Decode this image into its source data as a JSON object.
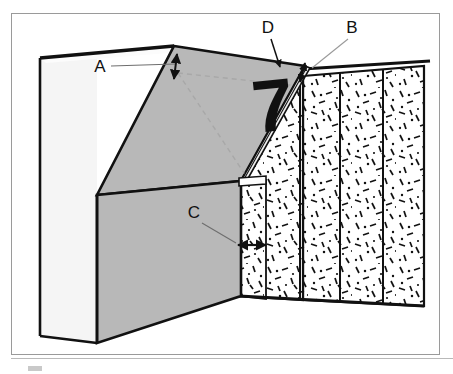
{
  "figure": {
    "type": "isometric-excavation-diagram",
    "numeral_marker": "7",
    "background_color": "#ffffff",
    "frame_color": "#9a9a9a"
  },
  "labels": [
    {
      "id": "A",
      "text": "A",
      "x": 100,
      "y": 72,
      "leader": "horizontal-right-to-vertical-double-arrow",
      "describes": "upper setback depth at crest of cut slope"
    },
    {
      "id": "B",
      "text": "B",
      "x": 352,
      "y": 33,
      "leader": "diagonal-down-left-to-vertical-double-arrow",
      "describes": "thickness measured at top of facing slab"
    },
    {
      "id": "C",
      "text": "C",
      "x": 194,
      "y": 218,
      "leader": "diagonal-down-right-to-horizontal-double-arrow",
      "describes": "horizontal width of lower facing element"
    },
    {
      "id": "D",
      "text": "D",
      "x": 268,
      "y": 33,
      "leader": "diagonal-down-right-to-arrowhead",
      "describes": "sloped face of the cut"
    }
  ],
  "surfaces": {
    "left_face": {
      "name": "left-vertical-face",
      "fill": "#f2f2f2"
    },
    "sloped_face": {
      "name": "sloped-cut-face",
      "fill": "#b8b8b8"
    },
    "front_face": {
      "name": "front-vertical-face",
      "fill": "#b8b8b8"
    },
    "top_face": {
      "name": "ground-surface-strip",
      "fill": "#fbfbfb"
    },
    "slab_edge": {
      "name": "thin-slab-edge",
      "fill": "#ededed"
    },
    "stipple_panels": {
      "name": "stippled-soil-panels",
      "fill": "#ffffff",
      "speckle_color": "#111111",
      "panel_count": 4
    }
  },
  "line_styles": {
    "outline": {
      "color": "#111111",
      "width": 2.6
    },
    "thin": {
      "color": "#111111",
      "width": 1.2
    },
    "hidden": {
      "color": "#a8a8a8",
      "width": 1.3,
      "dash": "5,4"
    },
    "leader": {
      "color": "#6e6e6e",
      "width": 1.0
    }
  }
}
